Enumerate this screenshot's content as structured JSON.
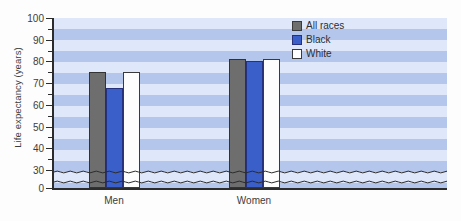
{
  "chart_data": {
    "type": "bar",
    "title": "",
    "xlabel": "",
    "ylabel": "Life expectancy (years)",
    "categories": [
      "Men",
      "Women"
    ],
    "series": [
      {
        "name": "All races",
        "color": "#6e6e6e",
        "values": [
          75,
          81
        ]
      },
      {
        "name": "Black",
        "color": "#3a5fc8",
        "values": [
          68,
          80
        ]
      },
      {
        "name": "White",
        "color": "#ffffff",
        "values": [
          75,
          81
        ]
      }
    ],
    "ylim": [
      0,
      100
    ],
    "y_ticks": [
      0,
      30,
      40,
      50,
      60,
      70,
      80,
      90,
      100
    ],
    "y_tick_labels": [
      "0",
      "30",
      "40",
      "50",
      "60",
      "70",
      "80",
      "90",
      "100"
    ],
    "y_axis_break": true,
    "y_axis_break_between": [
      0,
      30
    ],
    "grid": false,
    "legend_position": "top-right",
    "background": "horizontal blue stripes"
  },
  "axes": {
    "y_title": "Life expectancy (years)",
    "y_ticks": [
      {
        "label": "100",
        "value": 100
      },
      {
        "label": "90",
        "value": 90
      },
      {
        "label": "80",
        "value": 80
      },
      {
        "label": "70",
        "value": 70
      },
      {
        "label": "60",
        "value": 60
      },
      {
        "label": "50",
        "value": 50
      },
      {
        "label": "40",
        "value": 40
      },
      {
        "label": "30",
        "value": 30
      },
      {
        "label": "0",
        "value": 0
      }
    ],
    "x_ticks": [
      {
        "label": "Men"
      },
      {
        "label": "Women"
      }
    ]
  },
  "legend": {
    "items": [
      {
        "label": "All races",
        "color": "#6e6e6e"
      },
      {
        "label": "Black",
        "color": "#3a5fc8"
      },
      {
        "label": "White",
        "color": "#ffffff"
      }
    ]
  }
}
